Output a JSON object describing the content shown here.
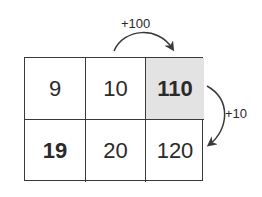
{
  "diagram": {
    "grid": {
      "rows": [
        [
          {
            "value": "9",
            "bold": false,
            "shaded": false
          },
          {
            "value": "10",
            "bold": false,
            "shaded": false
          },
          {
            "value": "110",
            "bold": true,
            "shaded": true
          }
        ],
        [
          {
            "value": "19",
            "bold": true,
            "shaded": false
          },
          {
            "value": "20",
            "bold": false,
            "shaded": false
          },
          {
            "value": "120",
            "bold": false,
            "shaded": false
          }
        ]
      ]
    },
    "arrows": [
      {
        "label": "+100",
        "from": "cell-10",
        "to": "cell-110",
        "direction": "right"
      },
      {
        "label": "+10",
        "from": "cell-110",
        "to": "cell-120",
        "direction": "down"
      }
    ],
    "colors": {
      "shade": "#e3e3e3",
      "line": "#3a3a3a",
      "text": "#2a2a2a"
    }
  }
}
